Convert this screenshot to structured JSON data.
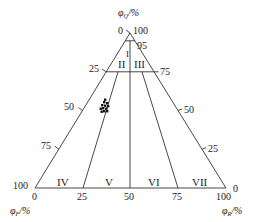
{
  "diagram": {
    "type": "ternary",
    "axes": {
      "top": {
        "symbol": "φ",
        "subscript": "Q",
        "unit": "/%",
        "apex_inner": "0",
        "apex_outer": "100"
      },
      "left": {
        "symbol": "φ",
        "subscript": "F",
        "unit": "/%",
        "corner_outer": "100",
        "corner_inner": "0"
      },
      "right": {
        "symbol": "φ",
        "subscript": "R",
        "unit": "/%",
        "corner_outer": "100",
        "corner_inner": "0"
      }
    },
    "ticks": {
      "top_95": "95",
      "left_edge": [
        "25",
        "50",
        "75"
      ],
      "right_edge": [
        "75",
        "50",
        "25"
      ],
      "base": [
        "25",
        "50",
        "75"
      ]
    },
    "regions": [
      "I",
      "II",
      "III",
      "IV",
      "V",
      "VI",
      "VII"
    ],
    "sample_points_count": 12
  }
}
